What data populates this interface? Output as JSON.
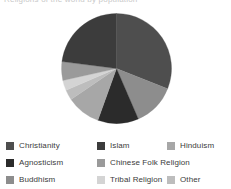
{
  "top_clipped_text": "Religions of the world by population",
  "chart_data": {
    "type": "pie",
    "title": "",
    "subtitle": "",
    "xlabel": "",
    "ylabel": "",
    "grid": false,
    "legend_position": "bottom",
    "legend_columns": 3,
    "start_angle_deg": 0,
    "direction": "clockwise",
    "labels": [
      "Christianity",
      "Agnosticism",
      "Buddhism",
      "Islam",
      "Chinese Folk Religion",
      "Tribal Religion",
      "Hinduism",
      "Other"
    ],
    "slices": [
      {
        "label": "Christianity",
        "value": 31.0,
        "color": "#4e4e4e"
      },
      {
        "label": "Agnosticism",
        "value": 12.0,
        "color": "#2b2b2b"
      },
      {
        "label": "Buddhism",
        "value": 12.5,
        "color": "#8d8d8d"
      },
      {
        "label": "Islam",
        "value": 23.0,
        "color": "#3c3c3c"
      },
      {
        "label": "Chinese Folk Religion",
        "value": 5.5,
        "color": "#9a9a9a"
      },
      {
        "label": "Tribal Religion",
        "value": 3.0,
        "color": "#d4d4d4"
      },
      {
        "label": "Hinduism",
        "value": 10.0,
        "color": "#a7a7a7"
      },
      {
        "label": "Other",
        "value": 3.0,
        "color": "#bdbdbd"
      }
    ],
    "draw_order": [
      {
        "label": "Christianity",
        "value": 31.0,
        "color": "#4e4e4e"
      },
      {
        "label": "Buddhism",
        "value": 12.5,
        "color": "#8d8d8d"
      },
      {
        "label": "Agnosticism",
        "value": 12.0,
        "color": "#2b2b2b"
      },
      {
        "label": "Hinduism",
        "value": 10.0,
        "color": "#a7a7a7"
      },
      {
        "label": "Other",
        "value": 3.0,
        "color": "#bdbdbd"
      },
      {
        "label": "Tribal Religion",
        "value": 3.0,
        "color": "#d4d4d4"
      },
      {
        "label": "Chinese Folk Religion",
        "value": 5.5,
        "color": "#9a9a9a"
      },
      {
        "label": "Islam",
        "value": 23.0,
        "color": "#3c3c3c"
      }
    ],
    "geometry": {
      "cx": 55.5,
      "cy": 55.5,
      "r": 55.0
    }
  },
  "legend": {
    "rows": [
      [
        {
          "label": "Christianity",
          "color": "#4e4e4e"
        },
        {
          "label": "Islam",
          "color": "#3c3c3c"
        },
        {
          "label": "Hinduism",
          "color": "#a7a7a7"
        }
      ],
      [
        {
          "label": "Agnosticism",
          "color": "#2b2b2b"
        },
        {
          "label": "Chinese Folk Religion",
          "color": "#9a9a9a"
        },
        {
          "label": "",
          "color": ""
        }
      ],
      [
        {
          "label": "Buddhism",
          "color": "#8d8d8d"
        },
        {
          "label": "Tribal Religion",
          "color": "#d4d4d4"
        },
        {
          "label": "Other",
          "color": "#bdbdbd"
        }
      ]
    ]
  }
}
